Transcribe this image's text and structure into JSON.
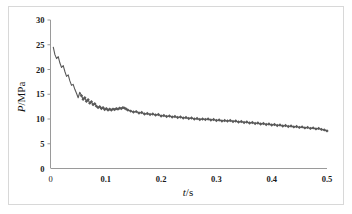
{
  "figure": {
    "background_color": "#ffffff",
    "frame_color": "#d8d8d8",
    "axis_color": "#9a9a9a",
    "series_color": "#595959"
  },
  "axis": {
    "x_title_var": "t",
    "x_title_unit": "/s",
    "y_title_var": "P",
    "y_title_unit": "/MPa",
    "x_ticks": [
      "0",
      "0.1",
      "0.2",
      "0.3",
      "0.4",
      "0.5"
    ],
    "y_ticks": [
      "0",
      "5",
      "10",
      "15",
      "20",
      "25",
      "30"
    ]
  },
  "chart_data": {
    "type": "line",
    "title": "",
    "xlabel": "t/s",
    "ylabel": "P/MPa",
    "xlim": [
      0,
      0.5
    ],
    "ylim": [
      0,
      30
    ],
    "xticks": [
      0,
      0.1,
      0.2,
      0.3,
      0.4,
      0.5
    ],
    "yticks": [
      0,
      5,
      10,
      15,
      20,
      25,
      30
    ],
    "grid": false,
    "legend": null,
    "marker": "diamond-dense",
    "series": [
      {
        "name": "Pressure decay",
        "x": [
          0.005,
          0.008,
          0.011,
          0.014,
          0.017,
          0.02,
          0.023,
          0.026,
          0.029,
          0.032,
          0.035,
          0.038,
          0.041,
          0.044,
          0.047,
          0.05,
          0.053,
          0.056,
          0.059,
          0.062,
          0.065,
          0.068,
          0.071,
          0.074,
          0.077,
          0.08,
          0.083,
          0.086,
          0.089,
          0.092,
          0.095,
          0.098,
          0.101,
          0.104,
          0.107,
          0.11,
          0.113,
          0.116,
          0.119,
          0.122,
          0.125,
          0.128,
          0.131,
          0.134,
          0.137,
          0.14,
          0.145,
          0.15,
          0.155,
          0.16,
          0.165,
          0.17,
          0.175,
          0.18,
          0.185,
          0.19,
          0.195,
          0.2,
          0.205,
          0.21,
          0.215,
          0.22,
          0.225,
          0.23,
          0.235,
          0.24,
          0.245,
          0.25,
          0.255,
          0.26,
          0.265,
          0.27,
          0.275,
          0.28,
          0.285,
          0.29,
          0.295,
          0.3,
          0.305,
          0.31,
          0.315,
          0.32,
          0.325,
          0.33,
          0.335,
          0.34,
          0.345,
          0.35,
          0.355,
          0.36,
          0.365,
          0.37,
          0.375,
          0.38,
          0.385,
          0.39,
          0.395,
          0.4,
          0.405,
          0.41,
          0.415,
          0.42,
          0.425,
          0.43,
          0.435,
          0.44,
          0.445,
          0.45,
          0.455,
          0.46,
          0.465,
          0.47,
          0.475,
          0.48,
          0.485,
          0.49,
          0.495,
          0.5
        ],
        "y": [
          24.5,
          23.0,
          22.2,
          22.6,
          21.3,
          20.4,
          20.8,
          19.6,
          18.6,
          18.9,
          17.7,
          16.8,
          17.0,
          16.0,
          15.2,
          14.3,
          15.4,
          14.7,
          14.0,
          14.3,
          13.6,
          13.9,
          13.2,
          13.5,
          12.9,
          13.1,
          12.6,
          12.3,
          12.5,
          12.1,
          12.3,
          11.9,
          12.1,
          11.8,
          12.0,
          11.8,
          12.0,
          11.9,
          12.1,
          12.0,
          12.2,
          12.1,
          12.3,
          12.2,
          12.0,
          11.8,
          11.6,
          11.4,
          11.5,
          11.2,
          11.3,
          11.0,
          11.1,
          10.9,
          11.0,
          10.8,
          10.9,
          10.6,
          10.7,
          10.5,
          10.6,
          10.4,
          10.5,
          10.3,
          10.4,
          10.2,
          10.3,
          10.1,
          10.2,
          10.0,
          10.1,
          9.9,
          10.0,
          9.9,
          10.0,
          9.8,
          9.9,
          9.7,
          9.8,
          9.6,
          9.7,
          9.6,
          9.7,
          9.5,
          9.6,
          9.4,
          9.5,
          9.3,
          9.4,
          9.2,
          9.3,
          9.1,
          9.2,
          9.0,
          9.1,
          8.9,
          9.0,
          8.8,
          8.9,
          8.7,
          8.8,
          8.6,
          8.7,
          8.5,
          8.6,
          8.4,
          8.5,
          8.3,
          8.4,
          8.2,
          8.3,
          8.1,
          8.2,
          8.0,
          8.1,
          7.9,
          7.8,
          7.6
        ]
      }
    ]
  }
}
